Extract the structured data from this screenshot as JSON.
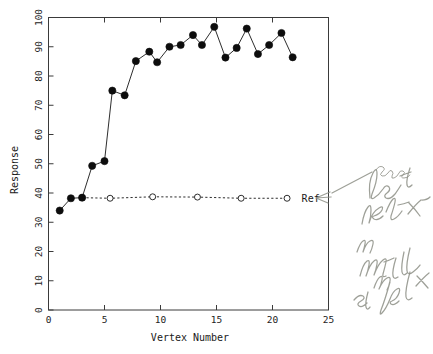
{
  "chart_data": {
    "type": "line",
    "title": "",
    "xlabel": "Vertex Number",
    "ylabel": "Response",
    "xlim": [
      0,
      25
    ],
    "ylim": [
      0,
      100
    ],
    "xticks": [
      0,
      5,
      10,
      15,
      20,
      25
    ],
    "yticks": [
      0,
      10,
      20,
      30,
      40,
      50,
      60,
      70,
      80,
      90,
      100
    ],
    "grid": false,
    "legend_position": "inline-right",
    "series": [
      {
        "name": "Response",
        "marker": "filled-circle",
        "linestyle": "solid",
        "x": [
          1,
          2,
          3,
          3.9,
          5,
          5.7,
          6.8,
          7.8,
          9,
          9.7,
          10.8,
          11.8,
          12.9,
          13.7,
          14.8,
          15.8,
          16.8,
          17.7,
          18.7,
          19.7,
          20.8,
          21.8
        ],
        "y": [
          34,
          38.2,
          38.4,
          49.3,
          50.9,
          75,
          73.4,
          85.1,
          88.3,
          84.7,
          90,
          90.6,
          94,
          90.6,
          96.8,
          86.3,
          89.6,
          96.2,
          87.5,
          90.6,
          94.7,
          86.4
        ]
      },
      {
        "name": "Ref",
        "marker": "open-circle",
        "linestyle": "dashed",
        "x": [
          3,
          5.5,
          9.3,
          13.3,
          17.2,
          21.3
        ],
        "y": [
          38.4,
          38.2,
          38.7,
          38.6,
          38.2,
          38.2
        ]
      }
    ],
    "annotations": [
      {
        "name": "ref-series-label",
        "text": "Ref",
        "x": 22.6,
        "y": 38.2
      }
    ]
  },
  "handwriting": {
    "note_lines": [
      "uses",
      "best",
      "vertex",
      "in",
      "initial",
      "simplex"
    ],
    "full_text": "uses best vertex in initial simplex",
    "arrow": "left-pointing-arrow-to-ref-label",
    "color": "#8d8f86"
  }
}
